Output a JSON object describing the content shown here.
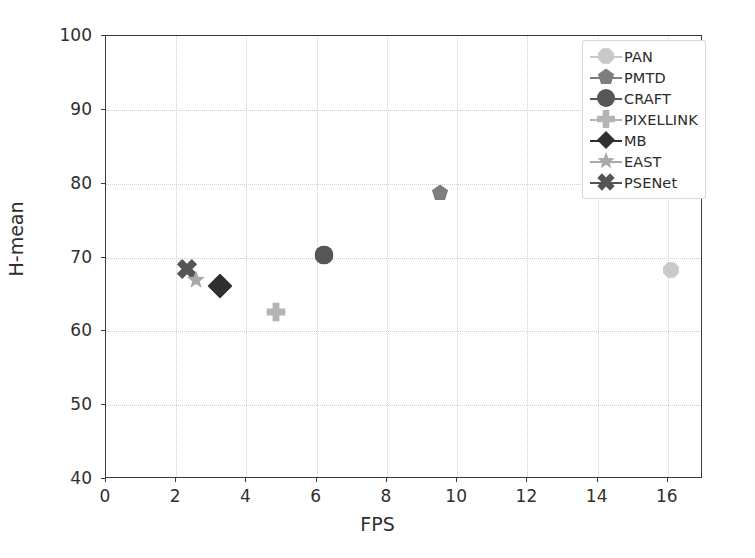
{
  "chart_data": {
    "type": "scatter",
    "title": "",
    "xlabel": "FPS",
    "ylabel": "H-mean",
    "xlim": [
      0,
      17
    ],
    "ylim": [
      40,
      100
    ],
    "xticks": [
      0,
      2,
      4,
      6,
      8,
      10,
      12,
      14,
      16
    ],
    "yticks": [
      40,
      50,
      60,
      70,
      80,
      90,
      100
    ],
    "grid": true,
    "legend_position": "upper right",
    "series": [
      {
        "name": "PAN",
        "marker": "octagon",
        "color": "#c9c9c9",
        "size": 17,
        "x": 16.1,
        "y": 68.3
      },
      {
        "name": "PMTD",
        "marker": "pentagon",
        "color": "#7d7d7d",
        "size": 17,
        "x": 9.5,
        "y": 78.8
      },
      {
        "name": "CRAFT",
        "marker": "circle",
        "color": "#565656",
        "size": 19,
        "x": 6.2,
        "y": 70.4
      },
      {
        "name": "PIXELLINK",
        "marker": "plus",
        "color": "#b4b4b4",
        "size": 19,
        "x": 4.85,
        "y": 62.6
      },
      {
        "name": "MB",
        "marker": "diamond",
        "color": "#2f2f2f",
        "size": 25,
        "x": 3.25,
        "y": 66.2
      },
      {
        "name": "EAST",
        "marker": "star",
        "color": "#a9a9a9",
        "size": 19,
        "x": 2.55,
        "y": 67.0
      },
      {
        "name": "PSENet",
        "marker": "x-thick",
        "color": "#555555",
        "size": 21,
        "x": 2.3,
        "y": 68.5
      }
    ]
  },
  "axes": {
    "xlabel": "FPS",
    "ylabel": "H-mean",
    "xtick_labels": [
      "0",
      "2",
      "4",
      "6",
      "8",
      "10",
      "12",
      "14",
      "16"
    ],
    "ytick_labels": [
      "40",
      "50",
      "60",
      "70",
      "80",
      "90",
      "100"
    ]
  },
  "legend": {
    "items": [
      {
        "label": "PAN"
      },
      {
        "label": "PMTD"
      },
      {
        "label": "CRAFT"
      },
      {
        "label": "PIXELLINK"
      },
      {
        "label": "MB"
      },
      {
        "label": "EAST"
      },
      {
        "label": "PSENet"
      }
    ]
  },
  "colors": {
    "axis": "#3a3a3a",
    "grid": "#cfcfcf",
    "text": "#2f2f2f",
    "background": "#ffffff"
  }
}
